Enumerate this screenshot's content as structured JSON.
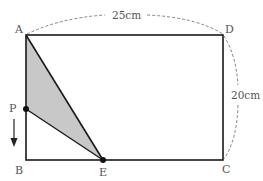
{
  "figure": {
    "type": "geometry",
    "shape": "rectangle ABCD with shaded triangle APE",
    "vertices": {
      "A": "A",
      "B": "B",
      "C": "C",
      "D": "D",
      "E": "E",
      "P": "P"
    },
    "dimensions": {
      "top": "25cm",
      "right": "20cm"
    },
    "colors": {
      "line": "#1a1a1a",
      "shade": "#c8c8c8",
      "dash": "#777777",
      "label": "#555555"
    },
    "arrow": "down (P moves toward B)"
  }
}
